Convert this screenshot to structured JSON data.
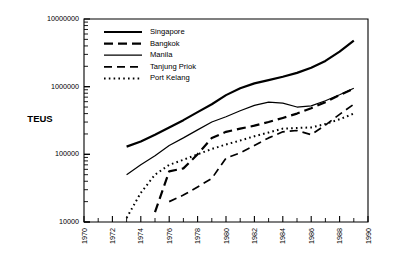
{
  "chart_data": {
    "type": "line",
    "title": "",
    "xlabel": "",
    "ylabel": "TEUS",
    "yscale": "log",
    "ylim": [
      10000,
      10000000
    ],
    "xlim": [
      1970,
      1990
    ],
    "grid": false,
    "legend_position": "top-left",
    "ytick_labels": [
      "10000",
      "100000",
      "1000000",
      "10000000"
    ],
    "ytick_values": [
      10000,
      100000,
      1000000,
      10000000
    ],
    "xtick_labels": [
      "1970",
      "1972",
      "1974",
      "1976",
      "1978",
      "1980",
      "1982",
      "1984",
      "1986",
      "1988",
      "1990"
    ],
    "xtick_values": [
      1970,
      1972,
      1974,
      1976,
      1978,
      1980,
      1982,
      1984,
      1986,
      1988,
      1990
    ],
    "xminor_step": 1,
    "series": [
      {
        "name": "Singapore",
        "style": "solid-thick",
        "stroke_width": 2.2,
        "dash": "none",
        "x": [
          1973,
          1974,
          1975,
          1976,
          1977,
          1978,
          1979,
          1980,
          1981,
          1982,
          1983,
          1984,
          1985,
          1986,
          1987,
          1988,
          1989
        ],
        "values": [
          130000,
          155000,
          195000,
          250000,
          320000,
          420000,
          550000,
          750000,
          950000,
          1120000,
          1250000,
          1400000,
          1600000,
          1900000,
          2400000,
          3300000,
          4800000
        ]
      },
      {
        "name": "Bangkok",
        "style": "dashed-thick",
        "stroke_width": 2.2,
        "dash": "9,5",
        "x": [
          1975,
          1976,
          1977,
          1978,
          1979,
          1980,
          1981,
          1982,
          1983,
          1984,
          1985,
          1986,
          1987,
          1988,
          1989
        ],
        "values": [
          14000,
          56000,
          62000,
          100000,
          175000,
          215000,
          240000,
          265000,
          300000,
          345000,
          400000,
          480000,
          590000,
          750000,
          940000
        ]
      },
      {
        "name": "Manila",
        "style": "solid-thin",
        "stroke_width": 1.2,
        "dash": "none",
        "x": [
          1973,
          1974,
          1975,
          1976,
          1977,
          1978,
          1979,
          1980,
          1981,
          1982,
          1983,
          1984,
          1985,
          1986,
          1987,
          1988,
          1989
        ],
        "values": [
          50000,
          70000,
          95000,
          135000,
          175000,
          230000,
          300000,
          360000,
          440000,
          530000,
          590000,
          570000,
          500000,
          520000,
          620000,
          760000,
          950000
        ]
      },
      {
        "name": "Tanjung Priok",
        "style": "dashed",
        "stroke_width": 1.7,
        "dash": "8,5",
        "x": [
          1976,
          1977,
          1978,
          1979,
          1980,
          1981,
          1982,
          1983,
          1984,
          1985,
          1986,
          1987,
          1988,
          1989
        ],
        "values": [
          20000,
          25000,
          33000,
          44000,
          88000,
          105000,
          135000,
          175000,
          215000,
          225000,
          195000,
          270000,
          390000,
          550000
        ]
      },
      {
        "name": "Port Kelang",
        "style": "dotted",
        "stroke_width": 2.0,
        "dash": "1.6,3.2",
        "x": [
          1973,
          1974,
          1975,
          1976,
          1977,
          1978,
          1979,
          1980,
          1981,
          1982,
          1983,
          1984,
          1985,
          1986,
          1987,
          1988,
          1989
        ],
        "values": [
          11500,
          27000,
          50000,
          70000,
          83000,
          100000,
          120000,
          140000,
          160000,
          185000,
          210000,
          240000,
          245000,
          250000,
          280000,
          330000,
          400000
        ]
      }
    ]
  },
  "legend": {
    "items": [
      {
        "label": "Singapore"
      },
      {
        "label": "Bangkok"
      },
      {
        "label": "Manila"
      },
      {
        "label": "Tanjung Priok"
      },
      {
        "label": "Port Kelang"
      }
    ]
  }
}
